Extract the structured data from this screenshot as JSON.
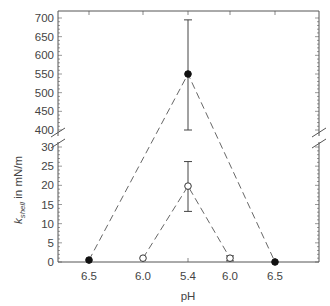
{
  "chart_data": {
    "type": "line",
    "title": "",
    "xlabel": "pH",
    "ylabel": "k_shell in mN/m",
    "ylabel_main": "k",
    "ylabel_sub": "shell",
    "ylabel_rest": " in mN/m",
    "categories": [
      "6.5",
      "6.0",
      "5.4",
      "6.0",
      "6.5"
    ],
    "y_axis_broken": true,
    "y_segments": [
      {
        "range": [
          0,
          30
        ],
        "ticks": [
          0,
          5,
          10,
          15,
          20,
          25,
          30
        ]
      },
      {
        "range": [
          400,
          700
        ],
        "ticks": [
          400,
          450,
          500,
          550,
          600,
          650,
          700
        ]
      }
    ],
    "grid": false,
    "legend": null,
    "series": [
      {
        "name": "filled-circles (outer)",
        "marker": "filled-circle",
        "line_style": "dashed",
        "points": [
          {
            "x": "6.5",
            "xi": 0,
            "y": 0.5
          },
          {
            "x": "5.4",
            "xi": 2,
            "y": 550,
            "err_low": 400,
            "err_high": 695
          },
          {
            "x": "6.5",
            "xi": 4,
            "y": 0
          }
        ]
      },
      {
        "name": "open-circles (inner)",
        "marker": "open-circle",
        "line_style": "dashed",
        "points": [
          {
            "x": "6.0",
            "xi": 1,
            "y": 1
          },
          {
            "x": "5.4",
            "xi": 2,
            "y": 19.8,
            "err_low": 13.2,
            "err_high": 26.2
          },
          {
            "x": "6.0",
            "xi": 3,
            "y": 1,
            "err_low": 0.3,
            "err_high": 1.6
          }
        ]
      }
    ]
  },
  "labels": {
    "x_ticks": [
      "6.5",
      "6.0",
      "5.4",
      "6.0",
      "6.5"
    ],
    "y_upper_ticks": [
      "400",
      "450",
      "500",
      "550",
      "600",
      "650",
      "700"
    ],
    "y_lower_ticks": [
      "0",
      "5",
      "10",
      "15",
      "20",
      "25",
      "30"
    ],
    "xlabel": "pH",
    "ylabel_main": "k",
    "ylabel_sub": "shell",
    "ylabel_rest": " in mN/m"
  }
}
